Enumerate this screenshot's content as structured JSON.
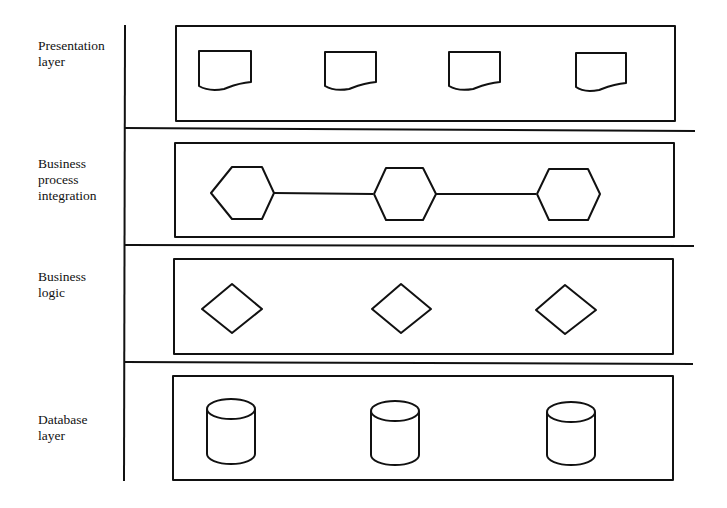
{
  "diagram": {
    "title": "",
    "layers": [
      {
        "id": "presentation",
        "label_lines": [
          "Presentation",
          "layer"
        ],
        "shape": "document",
        "count": 4
      },
      {
        "id": "business-process-integration",
        "label_lines": [
          "Business",
          "process",
          "integration"
        ],
        "shape": "hexagon",
        "count": 3,
        "connected": true
      },
      {
        "id": "business-logic",
        "label_lines": [
          "Business",
          "logic"
        ],
        "shape": "diamond",
        "count": 3
      },
      {
        "id": "database",
        "label_lines": [
          "Database",
          "layer"
        ],
        "shape": "cylinder",
        "count": 3
      }
    ],
    "colors": {
      "stroke": "#111111",
      "background": "#ffffff"
    }
  }
}
